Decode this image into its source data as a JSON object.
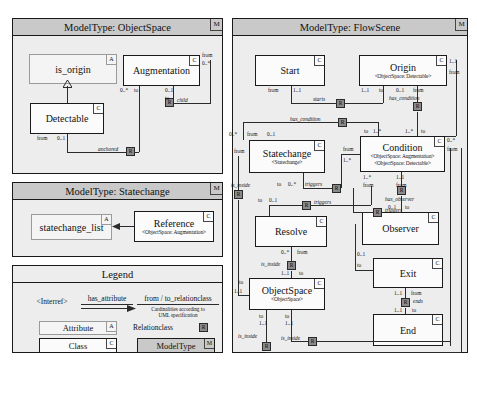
{
  "panels": {
    "objectspace": {
      "title": "ModelType: ObjectSpace",
      "corner": "M"
    },
    "statechange": {
      "title": "ModelType: Statechange",
      "corner": "M"
    },
    "legend": {
      "title": "Legend"
    },
    "flowscene": {
      "title": "ModelType: FlowScene",
      "corner": "M"
    }
  },
  "objectspace": {
    "boxes": [
      {
        "name": "is_origin",
        "tag": "A"
      },
      {
        "name": "Augmentation",
        "tag": "C"
      },
      {
        "name": "Detectable",
        "tag": "C"
      }
    ],
    "relations": [
      {
        "name": "anchored",
        "marker": "R"
      },
      {
        "name": "child",
        "marker": "R"
      }
    ],
    "cards": [
      "from",
      "0..*",
      "0..*",
      "to",
      "0..1",
      "to",
      "from",
      "0..1"
    ]
  },
  "statechange": {
    "boxes": [
      {
        "name": "statechange_list",
        "tag": "A"
      },
      {
        "name": "Reference",
        "stereotype": "<ObjectSpace: Augmentation>",
        "tag": "C"
      }
    ]
  },
  "legend": {
    "interref": "<Interref>",
    "has_attribute": "has_attribute",
    "relationclass_label": "from / to_relationclass",
    "cardinalities_line1": "Cardinalities according to",
    "cardinalities_line2": "UML specification",
    "attribute": "Attribute",
    "attribute_tag": "A",
    "class": "Class",
    "class_tag": "C",
    "relationclass": "Relationclass",
    "relationclass_marker": "R",
    "modeltype": "ModelType",
    "modeltype_tag": "M"
  },
  "flowscene": {
    "boxes": [
      {
        "name": "Start",
        "tag": "C"
      },
      {
        "name": "Origin",
        "stereotype": "<ObjectSpace: Detectable>",
        "tag": "C"
      },
      {
        "name": "Statechange",
        "stereotype": "<Statechange>",
        "tag": "C"
      },
      {
        "name": "Condition",
        "stereotype": "<ObjectSpace: Augmentation>",
        "stereotype2": "<ObjectSpace: Detectable>",
        "tag": "C"
      },
      {
        "name": "Resolve",
        "tag": "C"
      },
      {
        "name": "Observer",
        "tag": "C"
      },
      {
        "name": "ObjectSpace",
        "stereotype": "<ObjectSpace>",
        "tag": "C"
      },
      {
        "name": "Exit",
        "tag": "C"
      },
      {
        "name": "End",
        "tag": "C"
      }
    ],
    "relations": [
      {
        "name": "starts",
        "marker": "R"
      },
      {
        "name": "has_condition",
        "marker": "R"
      },
      {
        "name": "has_condition",
        "marker": "R"
      },
      {
        "name": "triggers",
        "marker": "R"
      },
      {
        "name": "triggers",
        "marker": "R"
      },
      {
        "name": "triggers",
        "marker": "R"
      },
      {
        "name": "has_observer",
        "marker": "R"
      },
      {
        "name": "is_inside",
        "marker": "R"
      },
      {
        "name": "is_inside",
        "marker": "R"
      },
      {
        "name": "is_inside",
        "marker": "R"
      },
      {
        "name": "is_inside",
        "marker": "R"
      },
      {
        "name": "ends",
        "marker": "R"
      }
    ]
  },
  "labels": {
    "from": "from",
    "to": "to",
    "c01": "0..1",
    "c11": "1..1",
    "c0n": "0..*",
    "c1n": "1..*"
  }
}
